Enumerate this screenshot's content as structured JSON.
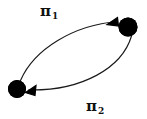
{
  "diagram": {
    "type": "directed-graph",
    "background_color": "#ffffff",
    "stroke_color": "#1a1a1a",
    "node_fill_color": "#000000",
    "nodes": [
      {
        "id": "node-top-right",
        "label": "",
        "shape": "filled-circle",
        "cx": 128,
        "cy": 27,
        "r": 9.5
      },
      {
        "id": "node-bottom-left",
        "label": "",
        "shape": "filled-circle",
        "cx": 17,
        "cy": 89,
        "r": 9.0
      }
    ],
    "edges": [
      {
        "id": "edge-pi1",
        "from": "node-bottom-left",
        "to": "node-top-right",
        "label_glyph": "π",
        "label_subscript": "1",
        "label_text": "π1",
        "direction": "left-to-right",
        "curvature": "bulge-up-left",
        "arrowhead": "filled-triangle",
        "path": "M 20.5 80.5 C 34 49 74 25 117.5 21.5",
        "arrow_points": "117.5,17.5 107.0,24.5 118.5,26.0"
      },
      {
        "id": "edge-pi2",
        "from": "node-top-right",
        "to": "node-bottom-left",
        "label_glyph": "π",
        "label_subscript": "2",
        "label_text": "π2",
        "direction": "right-to-left",
        "curvature": "bulge-down-right",
        "arrowhead": "filled-triangle",
        "path": "M 131.5 36.0 C 122 68 82 91 28.5 90.0",
        "arrow_points": "25.5,92.5 36.0,85.5 35.0,95.5"
      }
    ],
    "labels": [
      {
        "id": "label-pi1",
        "glyph": "π",
        "subscript": "1",
        "x": 40,
        "y": 3
      },
      {
        "id": "label-pi2",
        "glyph": "π",
        "subscript": "2",
        "x": 86,
        "y": 98
      }
    ]
  }
}
